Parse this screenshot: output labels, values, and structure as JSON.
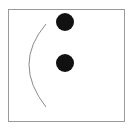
{
  "figure": {
    "frame": {
      "x": 8,
      "y": 9,
      "width": 117,
      "height": 113,
      "stroke": "#9a9a9a"
    },
    "dots": [
      {
        "name": "top-dot",
        "cx": 65,
        "cy": 22,
        "r": 9,
        "fill": "#111111"
      },
      {
        "name": "middle-dot",
        "cx": 65,
        "cy": 63,
        "r": 9,
        "fill": "#111111"
      }
    ],
    "arc": {
      "name": "left-arc",
      "d": "M46 24 Q 12 64 46 107",
      "stroke": "#8a8a8a",
      "stroke_width": 1
    }
  }
}
